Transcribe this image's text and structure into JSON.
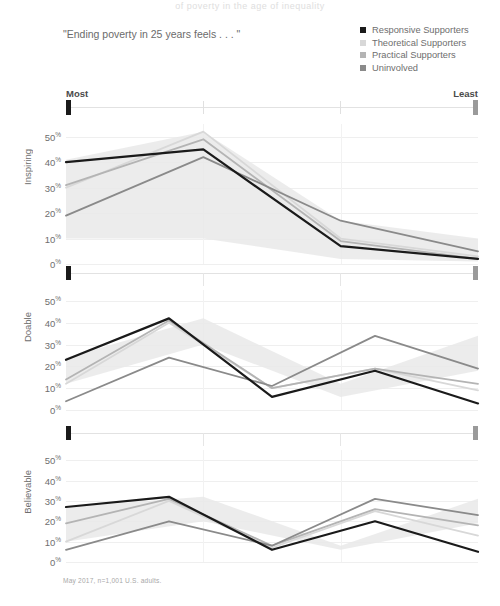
{
  "clipped_title": "of poverty in the age of inequality",
  "question_label": "\"Ending poverty in 25 years feels . . . \"",
  "footnote": "May 2017, n=1,001 U.S. adults.",
  "scale": {
    "most_label": "Most",
    "least_label": "Least"
  },
  "legend": {
    "items": [
      {
        "label": "Responsive Supporters",
        "color": "#1a1a1a"
      },
      {
        "label": "Theoretical Supporters",
        "color": "#d8d8d8"
      },
      {
        "label": "Practical Supporters",
        "color": "#b4b4b4"
      },
      {
        "label": "Uninvolved",
        "color": "#8a8a8a"
      }
    ]
  },
  "chart_data": {
    "type": "line",
    "title": "\"Ending poverty in 25 years feels . . . \"",
    "xlabel": "",
    "ylabel": "",
    "x": [
      "Most",
      "2",
      "3",
      "Least"
    ],
    "x_axis_endpoints": [
      "Most",
      "Least"
    ],
    "ylim": [
      0,
      55
    ],
    "yticks": [
      0,
      10,
      20,
      30,
      40,
      50
    ],
    "ytick_labels": [
      "0%",
      "10%",
      "20%",
      "30%",
      "40%",
      "50%"
    ],
    "grid": true,
    "legend_position": "top-right",
    "note": "Small multiples: three stacked line panels sharing a Most-to-Least x scale. A light gray band behind the lines shows the overall range.",
    "panels": [
      {
        "name": "Inspiring",
        "ylabel": "Inspiring",
        "band": {
          "upper": [
            41,
            52,
            17,
            10
          ],
          "lower": [
            10,
            10,
            2,
            1
          ]
        },
        "series": [
          {
            "name": "Responsive Supporters",
            "color": "#1a1a1a",
            "values": [
              40,
              45,
              7,
              2
            ]
          },
          {
            "name": "Theoretical Supporters",
            "color": "#d8d8d8",
            "values": [
              30,
              52,
              10,
              3
            ]
          },
          {
            "name": "Practical Supporters",
            "color": "#b4b4b4",
            "values": [
              31,
              49,
              9,
              2
            ]
          },
          {
            "name": "Uninvolved",
            "color": "#8a8a8a",
            "values": [
              19,
              42,
              17,
              5
            ]
          }
        ]
      },
      {
        "name": "Doable",
        "ylabel": "Doable",
        "band": {
          "upper": [
            24,
            42,
            12,
            34
          ],
          "lower": [
            12,
            30,
            6,
            18
          ]
        },
        "series": [
          {
            "name": "Responsive Supporters",
            "color": "#1a1a1a",
            "values": [
              23,
              42,
              6,
              18,
              3
            ]
          },
          {
            "name": "Theoretical Supporters",
            "color": "#d8d8d8",
            "values": [
              12,
              40,
              10,
              19,
              9
            ]
          },
          {
            "name": "Practical Supporters",
            "color": "#b4b4b4",
            "values": [
              14,
              41,
              10,
              19,
              12
            ]
          },
          {
            "name": "Uninvolved",
            "color": "#8a8a8a",
            "values": [
              4,
              24,
              11,
              34,
              19
            ]
          }
        ]
      },
      {
        "name": "Believable",
        "ylabel": "Believable",
        "band": {
          "upper": [
            27,
            32,
            8,
            31
          ],
          "lower": [
            10,
            20,
            6,
            19
          ]
        },
        "series": [
          {
            "name": "Responsive Supporters",
            "color": "#1a1a1a",
            "values": [
              27,
              32,
              6,
              20,
              5
            ]
          },
          {
            "name": "Theoretical Supporters",
            "color": "#d8d8d8",
            "values": [
              10,
              30,
              7,
              25,
              13
            ]
          },
          {
            "name": "Practical Supporters",
            "color": "#b4b4b4",
            "values": [
              19,
              31,
              8,
              26,
              18
            ]
          },
          {
            "name": "Uninvolved",
            "color": "#8a8a8a",
            "values": [
              6,
              20,
              8,
              31,
              23
            ]
          }
        ]
      }
    ]
  }
}
